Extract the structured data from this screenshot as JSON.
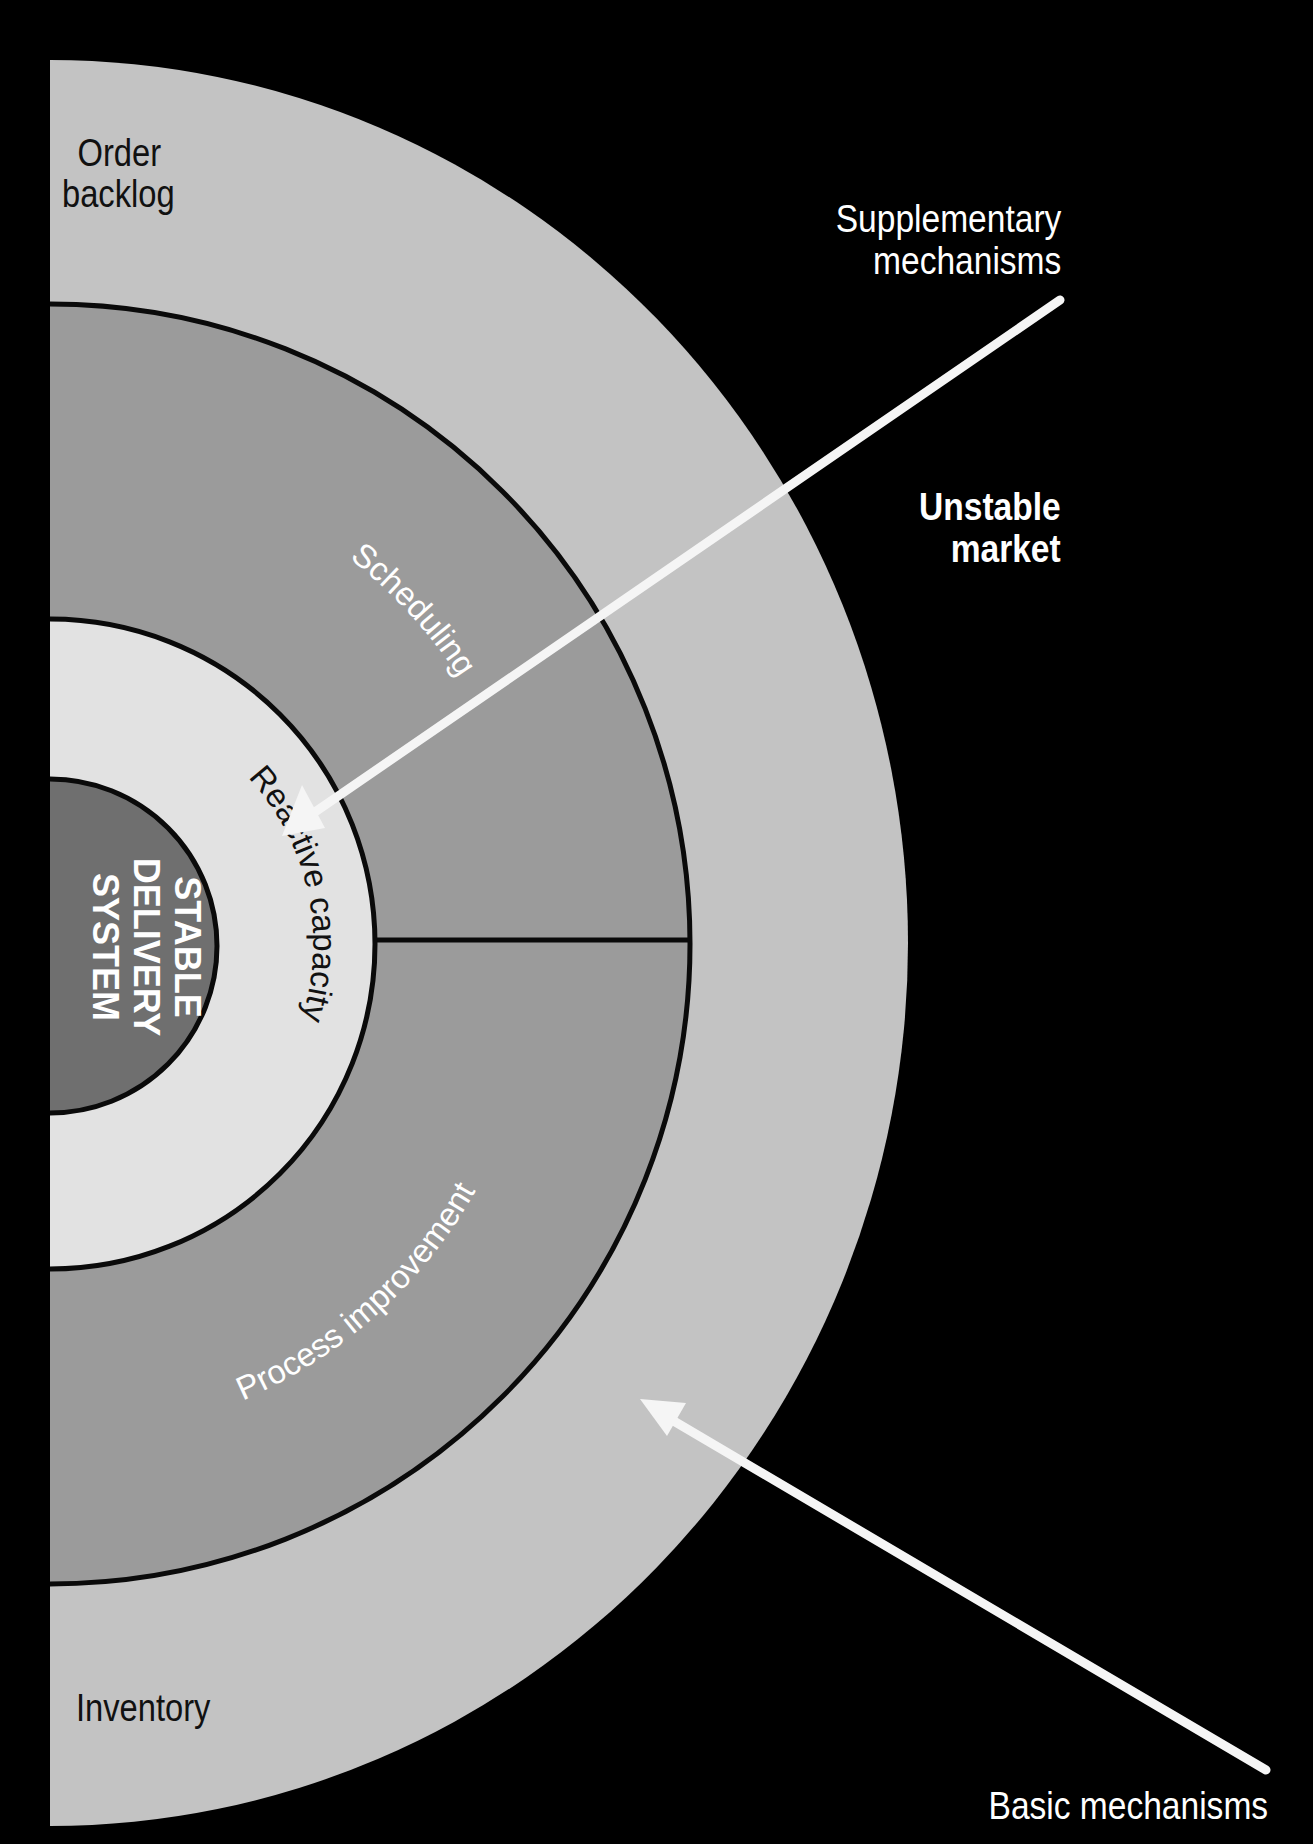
{
  "diagram": {
    "center": {
      "label_lines": [
        "STABLE",
        "DELIVERY",
        "SYSTEM"
      ]
    },
    "rings": {
      "reactive": "Reactive capacity",
      "scheduling": "Scheduling",
      "process_improvement": "Process improvement",
      "order_backlog": [
        "Order",
        "backlog"
      ],
      "inventory": "Inventory"
    },
    "annotations": {
      "supplementary": [
        "Supplementary",
        "mechanisms"
      ],
      "unstable_market": [
        "Unstable",
        "market"
      ],
      "basic": "Basic mechanisms"
    },
    "colors": {
      "background": "#000000",
      "outer_ring": "#c3c3c3",
      "middle_ring": "#9b9b9b",
      "reactive_ring": "#e2e2e2",
      "core": "#6f6f6f",
      "stroke": "#0a0a0a",
      "arrow": "#f5f5f5"
    }
  }
}
